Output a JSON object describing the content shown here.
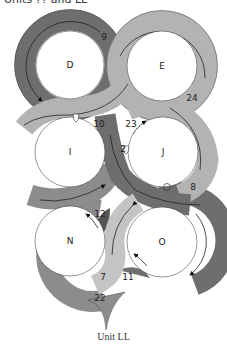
{
  "header": {
    "text": "Units ?? and LL"
  },
  "caption": "Unit LL",
  "colors": {
    "dark": "#6e6e6e",
    "medium": "#8c8c8c",
    "light": "#b3b3b3",
    "lighter": "#c4c4c4",
    "outline": "#333333",
    "background": "#ffffff"
  },
  "circles": [
    {
      "id": "D",
      "label": "D",
      "cx": 70,
      "cy": 65,
      "r": 34
    },
    {
      "id": "E",
      "label": "E",
      "cx": 162,
      "cy": 66,
      "r": 35
    },
    {
      "id": "I",
      "label": "I",
      "cx": 70,
      "cy": 152,
      "r": 35
    },
    {
      "id": "J",
      "label": "J",
      "cx": 163,
      "cy": 152,
      "r": 35
    },
    {
      "id": "N",
      "label": "N",
      "cx": 70,
      "cy": 241,
      "r": 35
    },
    {
      "id": "O",
      "label": "O",
      "cx": 162,
      "cy": 242,
      "r": 35
    }
  ],
  "numbers": [
    {
      "value": "9",
      "x": 104,
      "y": 40
    },
    {
      "value": "24",
      "x": 192,
      "y": 101
    },
    {
      "value": "10",
      "x": 95,
      "y": 127
    },
    {
      "value": "23",
      "x": 128,
      "y": 127
    },
    {
      "value": "2",
      "x": 121,
      "y": 151
    },
    {
      "value": "8",
      "x": 193,
      "y": 190
    },
    {
      "value": "12",
      "x": 95,
      "y": 217
    },
    {
      "value": "7",
      "x": 100,
      "y": 280
    },
    {
      "value": "11",
      "x": 123,
      "y": 280
    },
    {
      "value": "22",
      "x": 95,
      "y": 302
    }
  ],
  "markers": [
    {
      "type": "star-outline",
      "x": 76,
      "y": 118
    },
    {
      "type": "star-outline",
      "x": 126,
      "y": 149
    },
    {
      "type": "circle-outline",
      "x": 167,
      "y": 187
    }
  ]
}
